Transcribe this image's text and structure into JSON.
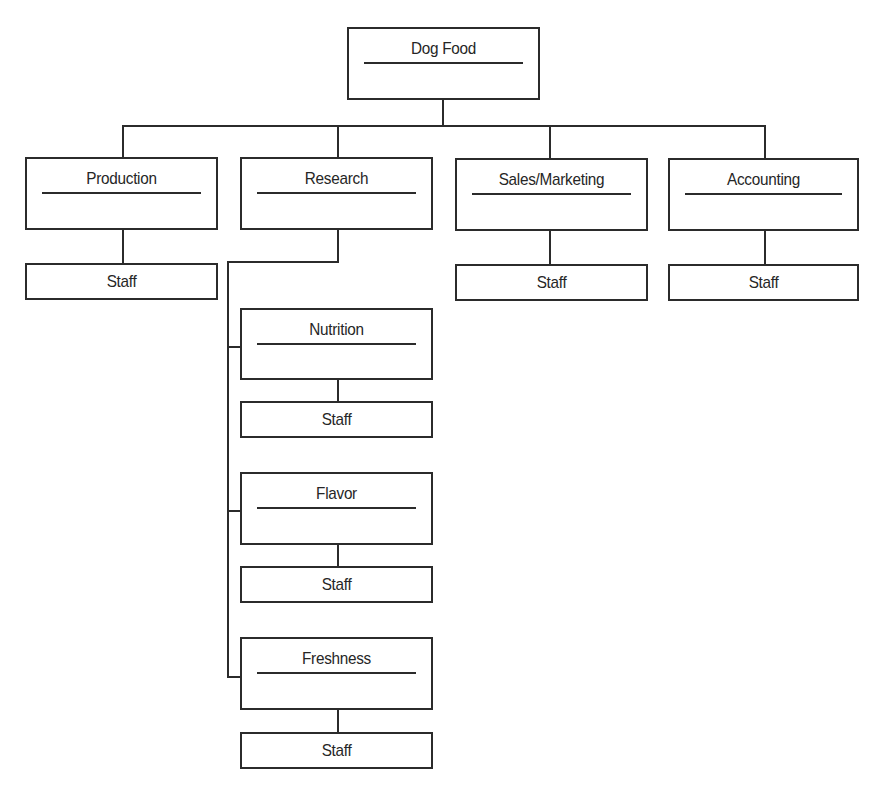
{
  "diagram": {
    "type": "org-chart",
    "root": {
      "label": "Dog Food",
      "box": {
        "x": 347,
        "y": 27,
        "w": 193,
        "h": 73
      }
    },
    "departments": [
      {
        "label": "Production",
        "box": {
          "x": 25,
          "y": 157,
          "w": 193,
          "h": 73
        },
        "staff": {
          "label": "Staff",
          "box": {
            "x": 25,
            "y": 263,
            "w": 193,
            "h": 37
          }
        }
      },
      {
        "label": "Research",
        "box": {
          "x": 240,
          "y": 157,
          "w": 193,
          "h": 73
        },
        "staff": null
      },
      {
        "label": "Sales/Marketing",
        "box": {
          "x": 455,
          "y": 158,
          "w": 193,
          "h": 73
        },
        "staff": {
          "label": "Staff",
          "box": {
            "x": 455,
            "y": 264,
            "w": 193,
            "h": 37
          }
        }
      },
      {
        "label": "Accounting",
        "box": {
          "x": 668,
          "y": 158,
          "w": 191,
          "h": 73
        },
        "staff": {
          "label": "Staff",
          "box": {
            "x": 668,
            "y": 264,
            "w": 191,
            "h": 37
          }
        }
      }
    ],
    "research_subunits": [
      {
        "label": "Nutrition",
        "box": {
          "x": 240,
          "y": 308,
          "w": 193,
          "h": 72
        },
        "staff": {
          "label": "Staff",
          "box": {
            "x": 240,
            "y": 401,
            "w": 193,
            "h": 37
          }
        }
      },
      {
        "label": "Flavor",
        "box": {
          "x": 240,
          "y": 472,
          "w": 193,
          "h": 73
        },
        "staff": {
          "label": "Staff",
          "box": {
            "x": 240,
            "y": 566,
            "w": 193,
            "h": 37
          }
        }
      },
      {
        "label": "Freshness",
        "box": {
          "x": 240,
          "y": 637,
          "w": 193,
          "h": 73
        },
        "staff": {
          "label": "Staff",
          "box": {
            "x": 240,
            "y": 732,
            "w": 193,
            "h": 37
          }
        }
      }
    ],
    "colors": {
      "line": "#2b2b2b",
      "text": "#262626",
      "background": "#ffffff"
    }
  }
}
